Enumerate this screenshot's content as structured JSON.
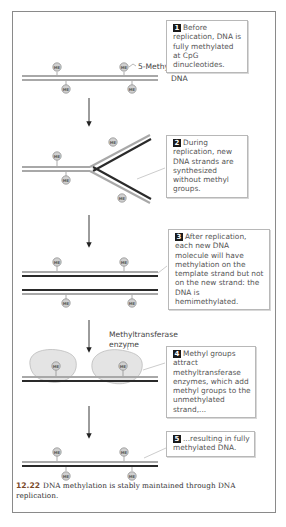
{
  "steps": [
    {
      "number": "1",
      "text": "Before replication, DNA is fully methylated at CpG dinucleotides."
    },
    {
      "number": "2",
      "text": "During replication, new DNA strands are synthesized without methyl groups."
    },
    {
      "number": "3",
      "text": "After replication, each new DNA molecule will have methylation on the template strand but not on the new strand: the DNA is hemimethylated."
    },
    {
      "number": "4",
      "text": "Methyl groups attract methyltransferase enzymes, which add methyl groups to the unmethylated strand,..."
    },
    {
      "number": "5",
      "text": "...resulting in fully methylated DNA."
    }
  ],
  "labels": {
    "methylcytosine": "5-Methylcytosine",
    "dna": "DNA",
    "enzyme_line1": "Methyltransferase",
    "enzyme_line2": "enzyme",
    "methyl_tag": "ME"
  },
  "caption": {
    "figure_number": "12.22",
    "text": "DNA methylation is stably maintained through DNA replication."
  },
  "colors": {
    "template_strand": "#a8a8a8",
    "new_strand": "#2a2a2a",
    "methyl_circle": "#d0d0d0",
    "enzyme_fill": "#e4e4e4",
    "step_badge": "#1a1a1a",
    "caption_number": "#7a4a2a"
  }
}
